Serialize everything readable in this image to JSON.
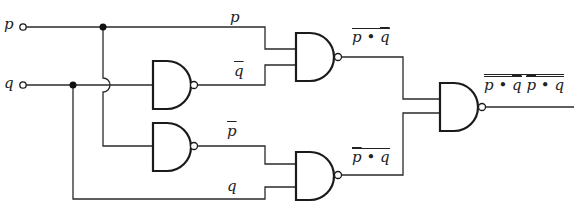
{
  "diagram": {
    "type": "logic-circuit",
    "gate_type": "NAND",
    "inputs": [
      {
        "name": "p",
        "label": "p"
      },
      {
        "name": "q",
        "label": "q"
      }
    ],
    "wire_labels": {
      "g3_in_top": "p",
      "g3_in_bottom": "q",
      "g4_in_top": "p",
      "g4_in_bottom": "q",
      "g3_out_p": "p",
      "g3_out_dot": "•",
      "g3_out_q": "q",
      "g4_out_p": "p",
      "g4_out_dot": "•",
      "g4_out_q": "q",
      "out_a_p": "p",
      "out_a_dot": "•",
      "out_a_q": "q",
      "out_b_p": "p",
      "out_b_dot": "•",
      "out_b_q": "q"
    },
    "expressions": {
      "g1": "q̄ (NAND q,q)",
      "g2": "p̄ (NAND p,p)",
      "g3": "NOT(p · q̄)",
      "g4": "NOT(p̄ · q)",
      "g5": "NOT( NOT(p · q̄) · NOT(p̄ · q) )"
    },
    "colors": {
      "line": "#1a1a1a",
      "background": "#ffffff"
    }
  }
}
